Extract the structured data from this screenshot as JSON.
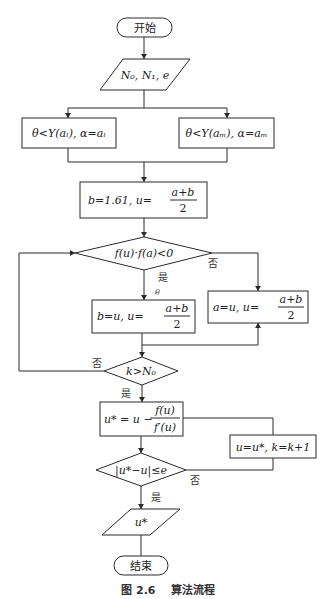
{
  "flowchart": {
    "start": "开始",
    "input": "N₀, N₁, e",
    "branch_left": "θ<Y(aₗ), α=aₗ",
    "branch_right": "θ<Y(aₘ), α=aₘ",
    "init": {
      "prefix": "b=1.61,  u=",
      "num": "a+b",
      "den": "2"
    },
    "cond1": "f(u)·f(a)<0",
    "cond1_yes": "是",
    "cond1_no": "否",
    "theta_note": "θ",
    "update_b": {
      "prefix": "b=u,  u=",
      "num": "a+b",
      "den": "2"
    },
    "update_a": {
      "prefix": "a=u,  u=",
      "num": "a+b",
      "den": "2"
    },
    "cond2": "k>N₀",
    "cond2_yes": "是",
    "cond2_no": "否",
    "newton": {
      "prefix": "u* = u −",
      "num": "f(u)",
      "den": "f′(u)"
    },
    "update_k": "u=u*, k=k+1",
    "cond3": "|u*−u|≤e",
    "cond3_yes": "是",
    "cond3_no": "否",
    "output": "u*",
    "end": "结束"
  },
  "caption": "图 2.6    算法流程"
}
